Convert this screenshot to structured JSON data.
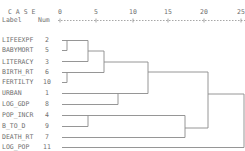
{
  "header": {
    "case_label": "C A S E",
    "label_col": "Label",
    "num_col": "Num"
  },
  "axis": {
    "ticks": [
      "0",
      "5",
      "10",
      "15",
      "20",
      "25"
    ]
  },
  "rows": [
    {
      "label": "LIFEEXPF",
      "num": "2"
    },
    {
      "label": "BABYMORT",
      "num": "5"
    },
    {
      "label": "LITERACY",
      "num": "3"
    },
    {
      "label": "BIRTH_RT",
      "num": "6"
    },
    {
      "label": "FERTILTY",
      "num": "10"
    },
    {
      "label": "URBAN",
      "num": "1"
    },
    {
      "label": "LOG_GDP",
      "num": "8"
    },
    {
      "label": "POP_INCR",
      "num": "4"
    },
    {
      "label": "B_TO_D",
      "num": "9"
    },
    {
      "label": "DEATH_RT",
      "num": "7"
    },
    {
      "label": "LOG_POP",
      "num": "11"
    }
  ],
  "colors": {
    "line": "#8a8a8a",
    "text": "#707070"
  }
}
